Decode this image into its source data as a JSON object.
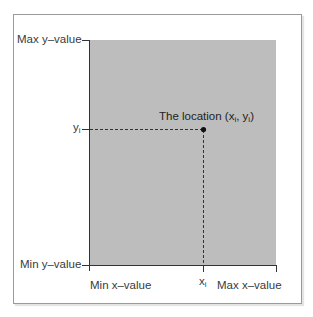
{
  "diagram": {
    "y_axis": {
      "max_label": "Max y–value",
      "min_label": "Min y–value",
      "point_label": "y",
      "point_label_sub": "i"
    },
    "x_axis": {
      "min_label": "Min x–value",
      "max_label": "Max x–value",
      "point_label": "x",
      "point_label_sub": "i"
    },
    "point": {
      "label_prefix": "The location (x",
      "label_sub1": "i",
      "label_mid": ", y",
      "label_sub2": "i",
      "label_suffix": ")"
    },
    "colors": {
      "plot_area": "#bdbdbd",
      "axis": "#333333",
      "point": "#111111",
      "frame": "#9a9a9a"
    }
  }
}
